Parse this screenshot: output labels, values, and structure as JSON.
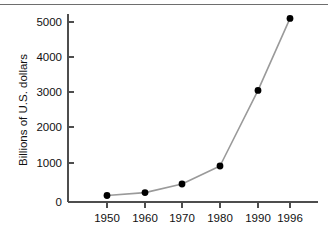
{
  "figure": {
    "background_color": "#ffffff",
    "top_rule_color": "#6e6e6e",
    "axis_color": "#4d4d4d",
    "line_color": "#9a9a9a",
    "marker_color": "#000000"
  },
  "chart_data": {
    "type": "line",
    "title": "",
    "xlabel": "",
    "ylabel": "Billions of U.S. dollars",
    "categories": [
      "1950",
      "1960",
      "1970",
      "1980",
      "1990",
      "1996"
    ],
    "x": [
      1950,
      1960,
      1970,
      1980,
      1990,
      1996
    ],
    "values": [
      180,
      260,
      500,
      1000,
      3100,
      5100
    ],
    "series": [
      {
        "name": "Billions of U.S. dollars",
        "values": [
          180,
          260,
          500,
          1000,
          3100,
          5100
        ]
      }
    ],
    "ylim": [
      0,
      5400
    ],
    "ytick_labels": [
      "0",
      "1000",
      "2000",
      "3000",
      "4000",
      "5000"
    ],
    "ytick_values": [
      0,
      1000,
      2000,
      3000,
      4000,
      5000
    ],
    "xtick_labels": [
      "1950",
      "1960",
      "1970",
      "1980",
      "1990",
      "1996"
    ],
    "grid": false,
    "legend": false,
    "markers": "filled-circle",
    "note": "x-axis spacing is uniform per tick; final interval 1990-1996 spans one tick slot"
  }
}
